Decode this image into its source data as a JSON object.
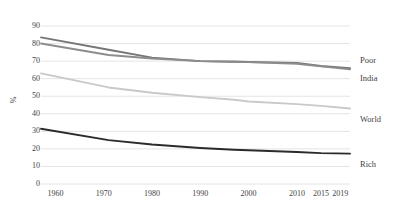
{
  "chart_data": {
    "type": "line",
    "title": "",
    "subtitle": "",
    "xlabel": "",
    "ylabel": "%",
    "ylim": [
      0,
      90
    ],
    "ytick_step": 10,
    "yticks": [
      "90",
      "80",
      "70",
      "60",
      "50",
      "40",
      "30",
      "20",
      "10",
      "0"
    ],
    "ytick_values": [
      90,
      80,
      70,
      60,
      50,
      40,
      30,
      20,
      10,
      0
    ],
    "xticks": [
      "1960",
      "1970",
      "1980",
      "1990",
      "2000",
      "2010",
      "2015",
      "2019"
    ],
    "xtick_values": [
      1960,
      1970,
      1980,
      1990,
      2000,
      2010,
      2015,
      2019
    ],
    "x": [
      1957,
      1971,
      1980,
      1990,
      1997,
      2000,
      2010,
      2015,
      2021
    ],
    "grid": true,
    "grid_axis": "y",
    "legend_position": "right-inline-end-labels",
    "series": [
      {
        "name": "Poor",
        "color": "#767676",
        "values": [
          83.5,
          76.5,
          72.0,
          70.0,
          69.8,
          69.5,
          69.0,
          67.2,
          66.0
        ]
      },
      {
        "name": "India",
        "color": "#8c8c8c",
        "values": [
          80.0,
          73.5,
          71.5,
          70.0,
          69.5,
          69.4,
          68.5,
          67.0,
          65.3
        ]
      },
      {
        "name": "World",
        "color": "#c9c9c9",
        "values": [
          63.0,
          55.0,
          52.0,
          49.5,
          48.0,
          47.0,
          45.5,
          44.5,
          43.0
        ]
      },
      {
        "name": "Rich",
        "color": "#2b2b2b",
        "values": [
          31.5,
          25.0,
          22.5,
          20.5,
          19.5,
          19.2,
          18.2,
          17.6,
          17.3
        ]
      }
    ]
  },
  "style": {
    "grid_color": "#e4e4e4",
    "axis_text_color": "#3f3f3f",
    "background": "#ffffff"
  }
}
